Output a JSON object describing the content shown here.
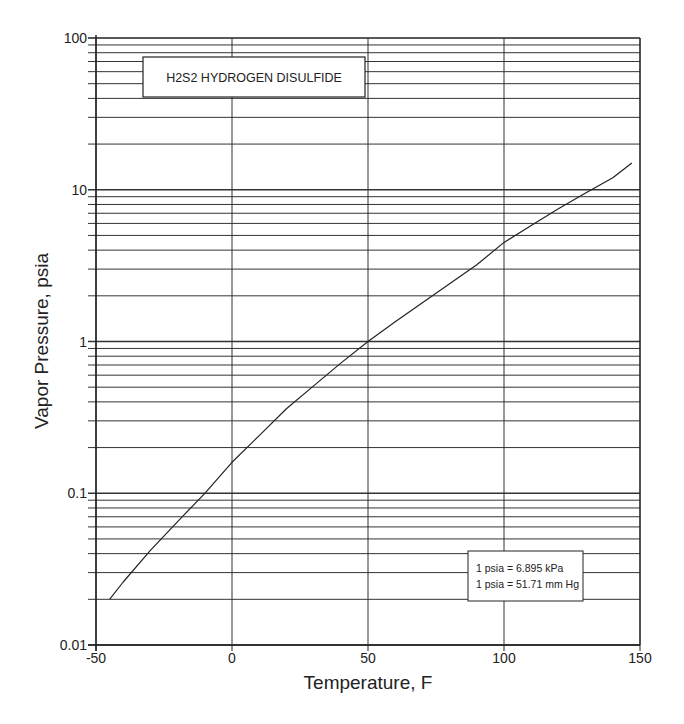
{
  "chart_data": {
    "type": "line",
    "title": "H2S2  HYDROGEN DISULFIDE",
    "xlabel": "Temperature, F",
    "ylabel": "Vapor Pressure, psia",
    "xlim": [
      -50,
      150
    ],
    "ylim": [
      0.01,
      100
    ],
    "yscale": "log",
    "x_ticks": [
      -50,
      0,
      50,
      100,
      150
    ],
    "x_tick_labels": [
      "-50",
      "0",
      "50",
      "100",
      "150"
    ],
    "y_ticks": [
      0.01,
      0.1,
      1,
      10,
      100
    ],
    "y_tick_labels": [
      "0.01",
      "0.1",
      "1",
      "10",
      "100"
    ],
    "grid": true,
    "series": [
      {
        "name": "H2S2 vapor pressure",
        "x": [
          -45,
          -40,
          -30,
          -20,
          -10,
          0,
          10,
          20,
          30,
          40,
          50,
          60,
          70,
          80,
          90,
          100,
          110,
          120,
          130,
          140,
          147
        ],
        "values": [
          0.02,
          0.026,
          0.042,
          0.065,
          0.1,
          0.16,
          0.24,
          0.36,
          0.51,
          0.72,
          1.0,
          1.35,
          1.8,
          2.4,
          3.2,
          4.5,
          5.8,
          7.5,
          9.5,
          12.0,
          15.0
        ]
      }
    ],
    "annotations": [
      "1 psia = 6.895 kPa",
      "1 psia = 51.71 mm Hg"
    ]
  },
  "title_box": {
    "text": "H2S2  HYDROGEN DISULFIDE"
  },
  "conversion_box": {
    "line1": "1 psia = 6.895 kPa",
    "line2": "1 psia = 51.71 mm Hg"
  },
  "axes": {
    "x_title": "Temperature, F",
    "y_title": "Vapor Pressure, psia",
    "x_labels": [
      "-50",
      "0",
      "50",
      "100",
      "150"
    ],
    "y_labels": [
      "100",
      "10",
      "1",
      "0.1",
      "0.01"
    ]
  },
  "colors": {
    "line": "#222222",
    "grid": "#333333",
    "background": "#ffffff"
  }
}
